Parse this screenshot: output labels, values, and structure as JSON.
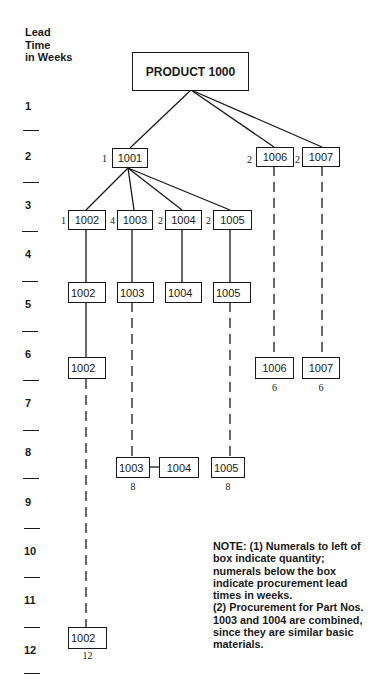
{
  "axis": {
    "header_lines": [
      "Lead",
      "Time",
      "in Weeks"
    ],
    "week_labels": [
      "1",
      "2",
      "3",
      "4",
      "5",
      "6",
      "7",
      "8",
      "9",
      "10",
      "11",
      "12"
    ]
  },
  "diagram": {
    "root": {
      "label": "PRODUCT 1000"
    },
    "level1": [
      {
        "part": "1001",
        "qty": "1"
      },
      {
        "part": "1006",
        "qty": "2"
      },
      {
        "part": "1007",
        "qty": "2"
      }
    ],
    "level2": [
      {
        "part": "1002",
        "qty": "1"
      },
      {
        "part": "1003",
        "qty": "4"
      },
      {
        "part": "1004",
        "qty": "2"
      },
      {
        "part": "1005",
        "qty": "2"
      }
    ],
    "week5_boxes": [
      "1002",
      "1003",
      "1004",
      "1005"
    ],
    "week6_boxes": [
      {
        "part": "1002",
        "lead": ""
      },
      {
        "part": "1006",
        "lead": "6"
      },
      {
        "part": "1007",
        "lead": "6"
      }
    ],
    "week8_boxes": [
      {
        "part": "1003",
        "lead": "8"
      },
      {
        "part": "1004",
        "lead": ""
      },
      {
        "part": "1005",
        "lead": "8"
      }
    ],
    "week12_boxes": [
      {
        "part": "1002",
        "lead": "12"
      }
    ]
  },
  "note": {
    "lines": [
      "NOTE: (1) Numerals to left of",
      "box indicate quantity;",
      "numerals below the box",
      "indicate procurement lead",
      "times in weeks.",
      "(2) Procurement for Part Nos.",
      "1003 and 1004 are combined,",
      "since they are similar basic",
      "materials."
    ]
  }
}
